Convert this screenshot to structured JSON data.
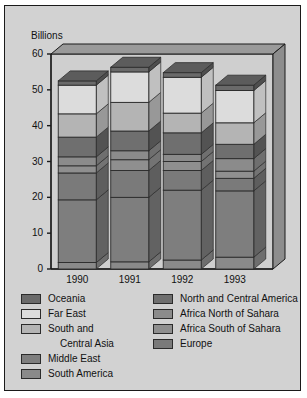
{
  "chart_data": {
    "type": "bar",
    "subtype": "stacked-3d",
    "title": "",
    "unit_label": "Billions",
    "xlabel": "",
    "ylabel": "Billions",
    "ylim": [
      0,
      60
    ],
    "yticks": [
      0,
      10,
      20,
      30,
      40,
      50,
      60
    ],
    "grid": false,
    "legend_position": "bottom",
    "categories": [
      "1990",
      "1991",
      "1992",
      "1993"
    ],
    "series": [
      {
        "name": "South America",
        "color": "#8a8a8a",
        "values": [
          1.8,
          2.0,
          2.5,
          3.3
        ]
      },
      {
        "name": "Middle East",
        "color": "#7e7e7e",
        "values": [
          17.5,
          18.0,
          19.5,
          18.5
        ]
      },
      {
        "name": "Europe",
        "color": "#7a7a7a",
        "values": [
          7.5,
          7.5,
          5.5,
          3.5
        ]
      },
      {
        "name": "Africa South of Sahara",
        "color": "#8f8f8f",
        "values": [
          2.0,
          3.0,
          2.5,
          2.0
        ]
      },
      {
        "name": "Africa North of Sahara",
        "color": "#8b8b8b",
        "values": [
          2.5,
          2.5,
          2.0,
          3.5
        ]
      },
      {
        "name": "North and Central America",
        "color": "#6f6f6f",
        "values": [
          5.5,
          5.5,
          6.0,
          4.0
        ]
      },
      {
        "name": "South and Central Asia",
        "color": "#b4b4b4",
        "values": [
          6.5,
          8.0,
          5.5,
          6.0
        ]
      },
      {
        "name": "Far East",
        "color": "#dcdcdc",
        "values": [
          8.0,
          8.5,
          10.0,
          9.0
        ]
      },
      {
        "name": "Oceania",
        "color": "#6a6a6a",
        "values": [
          1.2,
          1.3,
          1.3,
          1.5
        ]
      }
    ],
    "totals": [
      52.5,
      56.3,
      54.8,
      51.3
    ]
  },
  "axis": {
    "unit_label": "Billions",
    "y_ticks": [
      "60",
      "50",
      "40",
      "30",
      "20",
      "10",
      "0"
    ],
    "x_ticks": [
      "1990",
      "1991",
      "1992",
      "1993"
    ]
  },
  "legend": {
    "left_column": [
      {
        "label": "Oceania",
        "color": "#6a6a6a",
        "swatch": true,
        "indent": false
      },
      {
        "label": "Far East",
        "color": "#dcdcdc",
        "swatch": true,
        "indent": false
      },
      {
        "label": "South and",
        "color": "#b4b4b4",
        "swatch": true,
        "indent": false
      },
      {
        "label": "Central Asia",
        "color": "",
        "swatch": false,
        "indent": true
      },
      {
        "label": "Middle East",
        "color": "#7e7e7e",
        "swatch": true,
        "indent": false
      },
      {
        "label": "South America",
        "color": "#8a8a8a",
        "swatch": true,
        "indent": false
      }
    ],
    "right_column": [
      {
        "label": "North and Central America",
        "color": "#6f6f6f",
        "swatch": true,
        "indent": false
      },
      {
        "label": "Africa North of Sahara",
        "color": "#8b8b8b",
        "swatch": true,
        "indent": false
      },
      {
        "label": "Africa South of Sahara",
        "color": "#8f8f8f",
        "swatch": true,
        "indent": false
      },
      {
        "label": "Europe",
        "color": "#7a7a7a",
        "swatch": true,
        "indent": false
      }
    ]
  },
  "colors": {
    "background": "#d2d2d2",
    "frame_border": "#1a1a1a",
    "wall_face": "#cfcfcf",
    "wall_top": "#9a9a9a",
    "wall_side": "#8d8d8d",
    "axis_line": "#1a1a1a",
    "segment_border": "#2b2b2b"
  }
}
